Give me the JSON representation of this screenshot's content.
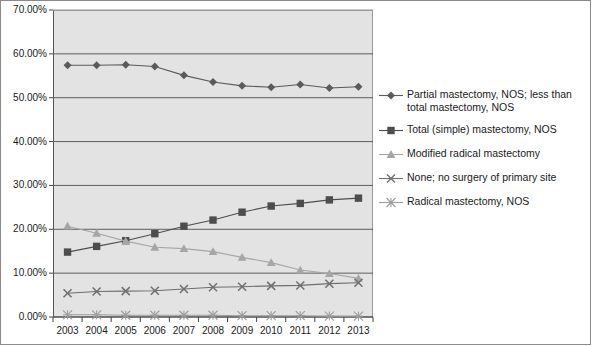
{
  "chart_data": {
    "type": "line",
    "title": "",
    "xlabel": "",
    "ylabel": "",
    "categories": [
      "2003",
      "2004",
      "2005",
      "2006",
      "2007",
      "2008",
      "2009",
      "2010",
      "2011",
      "2012",
      "2013"
    ],
    "ylim": [
      0,
      70
    ],
    "ytick_values": [
      0,
      10,
      20,
      30,
      40,
      50,
      60,
      70
    ],
    "ytick_labels": [
      "0.00%",
      "10.00%",
      "20.00%",
      "30.00%",
      "40.00%",
      "50.00%",
      "60.00%",
      "70.00%"
    ],
    "grid": true,
    "legend_position": "right",
    "series": [
      {
        "name": "Partial mastectomy, NOS; less than total mastectomy, NOS",
        "marker": "diamond",
        "color": "#5a5a5a",
        "values": [
          57.4,
          57.4,
          57.5,
          57.1,
          55.1,
          53.6,
          52.7,
          52.4,
          53.0,
          52.2,
          52.5
        ]
      },
      {
        "name": "Total (simple) mastectomy, NOS",
        "marker": "square",
        "color": "#4d4d4d",
        "values": [
          14.8,
          16.1,
          17.4,
          19.0,
          20.7,
          22.1,
          23.9,
          25.3,
          25.9,
          26.7,
          27.1
        ]
      },
      {
        "name": "Modified radical mastectomy",
        "marker": "triangle",
        "color": "#a6a6a6",
        "values": [
          20.7,
          19.1,
          17.3,
          15.9,
          15.6,
          14.9,
          13.6,
          12.4,
          10.7,
          9.9,
          8.8
        ]
      },
      {
        "name": "None; no surgery of primary site",
        "marker": "x",
        "color": "#6e6e6e",
        "values": [
          5.4,
          5.8,
          5.9,
          6.0,
          6.4,
          6.8,
          6.9,
          7.1,
          7.2,
          7.6,
          7.8
        ]
      },
      {
        "name": "Radical mastectomy, NOS",
        "marker": "asterisk",
        "color": "#9c9c9c",
        "values": [
          0.5,
          0.5,
          0.4,
          0.4,
          0.4,
          0.4,
          0.3,
          0.3,
          0.3,
          0.2,
          0.2
        ]
      }
    ]
  },
  "legend": {
    "items": [
      {
        "label": "Partial mastectomy, NOS; less than total mastectomy, NOS",
        "marker": "diamond",
        "color": "#5a5a5a"
      },
      {
        "label": "Total (simple) mastectomy, NOS",
        "marker": "square",
        "color": "#4d4d4d"
      },
      {
        "label": "Modified radical mastectomy",
        "marker": "triangle",
        "color": "#a6a6a6"
      },
      {
        "label": "None; no surgery of primary site",
        "marker": "x",
        "color": "#6e6e6e"
      },
      {
        "label": "Radical mastectomy, NOS",
        "marker": "asterisk",
        "color": "#9c9c9c"
      }
    ]
  }
}
